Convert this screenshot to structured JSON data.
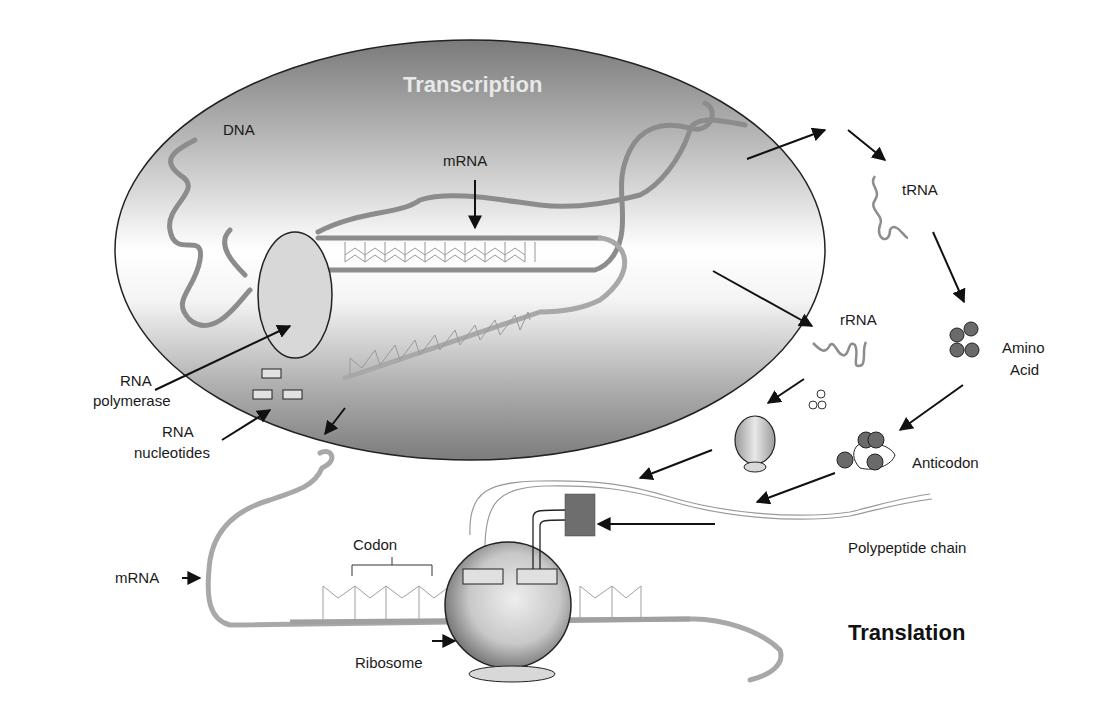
{
  "diagram": {
    "type": "biological process diagram"
  },
  "sections": {
    "transcription": {
      "title": "Transcription"
    },
    "translation": {
      "title": "Translation"
    }
  },
  "labels": {
    "dna": "DNA",
    "mrna_top": "mRNA",
    "rna_polymerase_line1": "RNA",
    "rna_polymerase_line2": "polymerase",
    "rna_nucleotides_line1": "RNA",
    "rna_nucleotides_line2": "nucleotides",
    "trna": "tRNA",
    "rrna": "rRNA",
    "amino_acid_line1": "Amino",
    "amino_acid_line2": "Acid",
    "anticodon": "Anticodon",
    "polypeptide_chain": "Polypeptide chain",
    "codon": "Codon",
    "mrna_bottom": "mRNA",
    "ribosome": "Ribosome"
  },
  "colors": {
    "nucleus_dark": "#7a7a7a",
    "nucleus_light": "#ffffff",
    "strand": "#8c8c8c",
    "amino_acid": "#666666",
    "peptide_block": "#6e6e6e",
    "outline": "#222222"
  }
}
